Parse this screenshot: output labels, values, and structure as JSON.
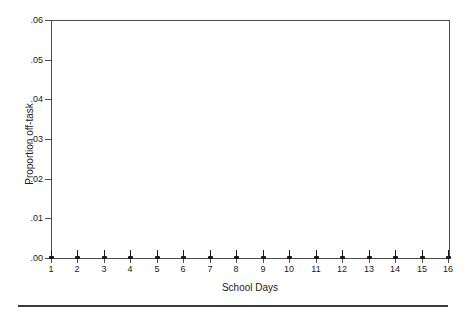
{
  "chart_data": {
    "type": "line",
    "title": "",
    "xlabel": "School Days",
    "ylabel": "Proportion off-task",
    "x": [
      1,
      2,
      3,
      4,
      5,
      6,
      7,
      8,
      9,
      10,
      11,
      12,
      13,
      14,
      15,
      16
    ],
    "categories": [
      "1",
      "2",
      "3",
      "4",
      "5",
      "6",
      "7",
      "8",
      "9",
      "10",
      "11",
      "12",
      "13",
      "14",
      "15",
      "16"
    ],
    "values": [
      0,
      0,
      0,
      0,
      0,
      0,
      0,
      0,
      0,
      0,
      0,
      0,
      0,
      0,
      0,
      0
    ],
    "series": [
      {
        "name": "Proportion off-task",
        "values": [
          0,
          0,
          0,
          0,
          0,
          0,
          0,
          0,
          0,
          0,
          0,
          0,
          0,
          0,
          0,
          0
        ]
      }
    ],
    "ylim": [
      0,
      0.06
    ],
    "xlim": [
      1,
      16
    ],
    "ytick_labels": [
      ".06",
      ".05",
      ".04",
      ".03",
      ".02",
      ".01",
      ".00"
    ],
    "ytick_values": [
      0.06,
      0.05,
      0.04,
      0.03,
      0.02,
      0.01,
      0.0
    ],
    "xtick_labels": [
      "1",
      "2",
      "3",
      "4",
      "5",
      "6",
      "7",
      "8",
      "9",
      "10",
      "11",
      "12",
      "13",
      "14",
      "15",
      "16"
    ],
    "grid": false,
    "legend": "none",
    "marker_style": "pin",
    "colors": {
      "axis": "#4d4d4d",
      "marker": "#1a1a1a",
      "text": "#1a1a1a",
      "rule": "#3a3a3a",
      "background": "#ffffff"
    }
  }
}
